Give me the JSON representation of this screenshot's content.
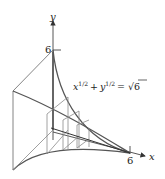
{
  "figure": {
    "axes": {
      "x_label": "x",
      "y_label": "y",
      "x_tick": "6",
      "y_tick": "6"
    },
    "equation": {
      "base_x": "x",
      "exp_x": "1/2",
      "plus": "+",
      "base_y": "y",
      "exp_y": "1/2",
      "equals": "=",
      "sqrt_arg": "6"
    },
    "colors": {
      "stroke": "#555555",
      "light_stroke": "#8a8a8a",
      "text": "#222222"
    }
  }
}
